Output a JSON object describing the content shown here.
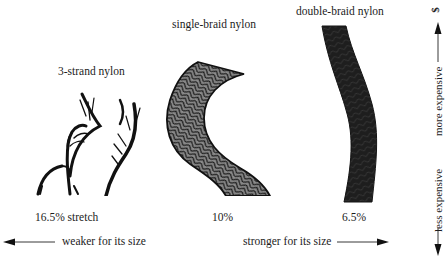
{
  "ropes": [
    {
      "name": "3-strand nylon",
      "stretch": "16.5% stretch"
    },
    {
      "name": "single-braid nylon",
      "stretch": "10%"
    },
    {
      "name": "double-braid nylon",
      "stretch": "6.5%"
    }
  ],
  "horizontal_axis": {
    "left_label": "weaker for its size",
    "right_label": "stronger for its size",
    "left_icon": "arrow-left-icon",
    "right_icon": "arrow-right-icon"
  },
  "vertical_axis": {
    "top_symbol": "$",
    "upper_label": "more expensive",
    "lower_label": "less expensive",
    "up_icon": "arrow-up-icon",
    "down_icon": "arrow-down-icon"
  },
  "colors": {
    "ink": "#1c1c1c",
    "single_braid_fill": "#8a8a8a",
    "double_braid_fill": "#1e1e1e",
    "background": "#ffffff"
  }
}
